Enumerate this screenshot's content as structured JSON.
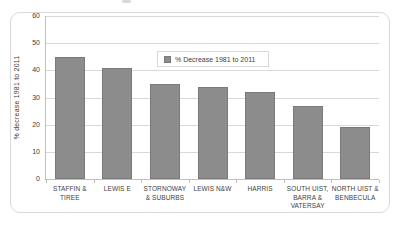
{
  "chart_data": {
    "type": "bar",
    "categories": [
      "STAFFIN &\nTIREE",
      "LEWIS E",
      "STORNOWAY\n& SUBURBS",
      "LEWIS N&W",
      "HARRIS",
      "SOUTH UIST,\nBARRA &\nVATERSAY",
      "NORTH UIST &\nBENBECULA"
    ],
    "values": [
      45,
      41,
      35,
      34,
      32,
      27,
      19
    ],
    "series_name": "% Decrease 1981 to 2011",
    "title": "",
    "xlabel": "",
    "ylabel": "% decrease 1981 to 2011",
    "ylim": [
      0,
      60
    ],
    "yticks": [
      0,
      10,
      20,
      30,
      40,
      50,
      60
    ],
    "grid": true,
    "legend_position": "inside-top-center-right",
    "colors": {
      "bar_fill": "#8C8C8C",
      "bar_border": "#7A7A7A",
      "gridline": "#D9D9D9",
      "axis": "#BFBFBF",
      "text": "#404040",
      "panel_border": "#D9D9D9",
      "background": "#FFFFFF"
    }
  }
}
